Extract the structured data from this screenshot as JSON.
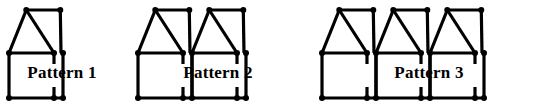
{
  "figure": {
    "background_color": "#ffffff",
    "ink_color": "#000000",
    "stick_thickness": 3.2,
    "node_radius": 3.0,
    "width": 559,
    "height": 112
  },
  "patterns": [
    {
      "id": "pattern-1",
      "label": "Pattern 1",
      "houses": 1,
      "origin_x": 9,
      "label_x": 62,
      "label_y": 74,
      "geometry": {
        "unit_width": 54,
        "apex_y": 10,
        "mid_y": 53,
        "base_y": 98,
        "stub_length": 11
      }
    },
    {
      "id": "pattern-2",
      "label": "Pattern 2",
      "houses": 2,
      "origin_x": 138,
      "label_x": 218,
      "label_y": 74,
      "geometry": {
        "unit_width": 54,
        "apex_y": 10,
        "mid_y": 53,
        "base_y": 98,
        "stub_length": 11
      }
    },
    {
      "id": "pattern-3",
      "label": "Pattern 3",
      "houses": 3,
      "origin_x": 322,
      "label_x": 429,
      "label_y": 74,
      "geometry": {
        "unit_width": 54,
        "apex_y": 10,
        "mid_y": 53,
        "base_y": 98,
        "stub_length": 11
      }
    }
  ],
  "chart_data": {
    "type": "diagram",
    "categories": [
      "Pattern 1",
      "Pattern 2",
      "Pattern 3"
    ],
    "houses": [
      1,
      2,
      3
    ],
    "xlabel": "Pattern",
    "ylabel": "Number of houses"
  }
}
